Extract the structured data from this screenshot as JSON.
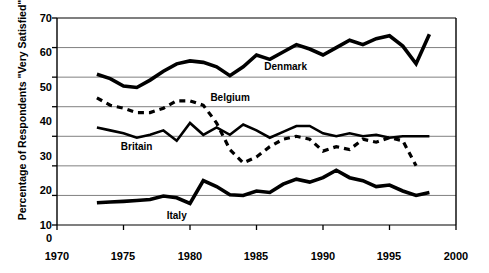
{
  "chart_data": {
    "type": "line",
    "title": "",
    "xlabel": "",
    "ylabel": "Percentage of Respondents \"Very Satisfied\"",
    "xlim": [
      1970,
      2000
    ],
    "ylim": [
      0,
      70
    ],
    "xticks": [
      1970,
      1975,
      1980,
      1985,
      1990,
      1995,
      2000
    ],
    "yticks": [
      0,
      10,
      20,
      30,
      40,
      50,
      60,
      70
    ],
    "grid": "horizontal",
    "legend": "inline-annotations",
    "series": [
      {
        "name": "Denmark",
        "style": "solid",
        "width": 3.6,
        "color": "#000000",
        "label_x": 1987.2,
        "label_y": 53.5,
        "x": [
          1973,
          1974,
          1975,
          1976,
          1977,
          1978,
          1979,
          1980,
          1981,
          1982,
          1983,
          1984,
          1985,
          1986,
          1987,
          1988,
          1989,
          1990,
          1991,
          1992,
          1993,
          1994,
          1995,
          1996,
          1997,
          1998
        ],
        "y": [
          51.0,
          49.5,
          47.0,
          46.5,
          49.0,
          52.0,
          54.5,
          55.5,
          55.0,
          53.5,
          50.5,
          53.5,
          57.5,
          56.0,
          58.5,
          61.0,
          59.5,
          57.5,
          60.0,
          62.5,
          61.0,
          63.0,
          64.0,
          60.5,
          54.5,
          64.5
        ]
      },
      {
        "name": "Belgium",
        "style": "dashed",
        "width": 3.2,
        "color": "#000000",
        "label_x": 1983.0,
        "label_y": 43.0,
        "x": [
          1973,
          1974,
          1975,
          1976,
          1977,
          1978,
          1979,
          1980,
          1981,
          1982,
          1983,
          1984,
          1985,
          1986,
          1987,
          1988,
          1989,
          1990,
          1991,
          1992,
          1993,
          1994,
          1995,
          1996,
          1997
        ],
        "y": [
          43.0,
          40.5,
          39.5,
          38.0,
          38.0,
          39.5,
          42.0,
          42.0,
          40.5,
          34.5,
          25.5,
          21.0,
          23.0,
          26.5,
          29.0,
          30.0,
          29.0,
          25.0,
          26.5,
          25.5,
          29.0,
          28.0,
          29.5,
          28.5,
          20.0
        ]
      },
      {
        "name": "Britain",
        "style": "solid",
        "width": 2.6,
        "color": "#000000",
        "label_x": 1976.0,
        "label_y": 26.5,
        "x": [
          1973,
          1974,
          1975,
          1976,
          1977,
          1978,
          1979,
          1980,
          1981,
          1982,
          1983,
          1984,
          1985,
          1986,
          1987,
          1988,
          1989,
          1990,
          1991,
          1992,
          1993,
          1994,
          1995,
          1996,
          1997,
          1998
        ],
        "y": [
          33.0,
          32.0,
          31.0,
          29.5,
          30.5,
          32.0,
          28.5,
          34.5,
          30.5,
          33.0,
          30.5,
          34.0,
          32.0,
          29.5,
          31.5,
          33.5,
          33.5,
          31.0,
          30.0,
          31.0,
          30.0,
          30.5,
          29.5,
          30.0,
          30.0,
          30.0
        ]
      },
      {
        "name": "Italy",
        "style": "solid",
        "width": 3.6,
        "color": "#000000",
        "label_x": 1979.0,
        "label_y": 3.2,
        "x": [
          1973,
          1974,
          1975,
          1976,
          1977,
          1978,
          1979,
          1980,
          1981,
          1982,
          1983,
          1984,
          1985,
          1986,
          1987,
          1988,
          1989,
          1990,
          1991,
          1992,
          1993,
          1994,
          1995,
          1996,
          1997,
          1998
        ],
        "y": [
          7.5,
          7.8,
          8.0,
          8.3,
          8.6,
          9.8,
          9.2,
          7.3,
          15.0,
          13.0,
          10.2,
          10.0,
          11.5,
          11.0,
          13.8,
          15.5,
          14.5,
          16.0,
          18.5,
          16.0,
          15.0,
          13.0,
          13.5,
          11.5,
          10.0,
          11.0
        ]
      }
    ]
  },
  "axes": {
    "y_tick_labels": [
      "70",
      "60",
      "50",
      "40",
      "30",
      "20",
      "10",
      "0"
    ],
    "x_tick_labels": [
      "1970",
      "1975",
      "1980",
      "1985",
      "1990",
      "1995",
      "2000"
    ],
    "y_axis_title": "Percentage of Respondents \"Very Satisfied\""
  },
  "series_labels": {
    "denmark": "Denmark",
    "belgium": "Belgium",
    "britain": "Britain",
    "italy": "Italy"
  },
  "colors": {
    "line": "#000000",
    "grid": "#808080",
    "axis": "#000000",
    "background": "#ffffff"
  }
}
